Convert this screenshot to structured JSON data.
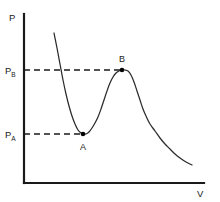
{
  "figure": {
    "background_color": "#ffffff",
    "line_color": "#2b2b2b",
    "axis_color": "#1a1a1a"
  },
  "axes": {
    "y_label": "P",
    "x_label": "V"
  },
  "y_ticks": [
    {
      "id": "pb",
      "base": "P",
      "sub": "B",
      "value_y": 70
    },
    {
      "id": "pa",
      "base": "P",
      "sub": "A",
      "value_y": 134
    }
  ],
  "points": [
    {
      "label": "A",
      "kind": "local-minimum",
      "x": 83,
      "y": 134
    },
    {
      "label": "B",
      "kind": "local-maximum",
      "x": 122,
      "y": 70
    }
  ],
  "chart_data": {
    "type": "line",
    "title": "",
    "subtitle": "",
    "xlabel": "V",
    "ylabel": "P",
    "grid": false,
    "legend": null,
    "axis_origin_px": [
      24,
      183
    ],
    "axis_top_px": [
      24,
      14
    ],
    "axis_right_px": [
      204,
      183
    ],
    "annotations": [
      {
        "text": "A",
        "x_px": 83,
        "y_px": 146,
        "describes": "local minimum of isotherm"
      },
      {
        "text": "B",
        "x_px": 122,
        "y_px": 61,
        "describes": "local maximum of isotherm"
      },
      {
        "text": "P_B",
        "x_px": 12,
        "y_px": 73,
        "describes": "pressure level of point B"
      },
      {
        "text": "P_A",
        "x_px": 12,
        "y_px": 137,
        "describes": "pressure level of point A"
      }
    ],
    "guide_lines": [
      {
        "type": "horizontal-dashed",
        "from_px": [
          24,
          70
        ],
        "to_px": [
          122,
          70
        ],
        "label": "P_B"
      },
      {
        "type": "horizontal-dashed",
        "from_px": [
          24,
          134
        ],
        "to_px": [
          83,
          134
        ],
        "label": "P_A"
      }
    ],
    "series": [
      {
        "name": "van der Waals isotherm",
        "points_px": [
          [
            54,
            33
          ],
          [
            57,
            48
          ],
          [
            60,
            64
          ],
          [
            63,
            80
          ],
          [
            66,
            94
          ],
          [
            69,
            106
          ],
          [
            72,
            116
          ],
          [
            75,
            124
          ],
          [
            78,
            130
          ],
          [
            81,
            133
          ],
          [
            83,
            134
          ],
          [
            86,
            134
          ],
          [
            89,
            132
          ],
          [
            92,
            128
          ],
          [
            95,
            123
          ],
          [
            98,
            117
          ],
          [
            101,
            109
          ],
          [
            104,
            100
          ],
          [
            107,
            91
          ],
          [
            110,
            83
          ],
          [
            113,
            77
          ],
          [
            116,
            73
          ],
          [
            119,
            71
          ],
          [
            122,
            70
          ],
          [
            125,
            70
          ],
          [
            128,
            71
          ],
          [
            131,
            75
          ],
          [
            134,
            82
          ],
          [
            137,
            91
          ],
          [
            140,
            100
          ],
          [
            143,
            109
          ],
          [
            146,
            116
          ],
          [
            150,
            124
          ],
          [
            155,
            131
          ],
          [
            160,
            138
          ],
          [
            165,
            144
          ],
          [
            170,
            149
          ],
          [
            175,
            154
          ],
          [
            180,
            158
          ],
          [
            186,
            162
          ],
          [
            192,
            165
          ]
        ]
      }
    ]
  }
}
